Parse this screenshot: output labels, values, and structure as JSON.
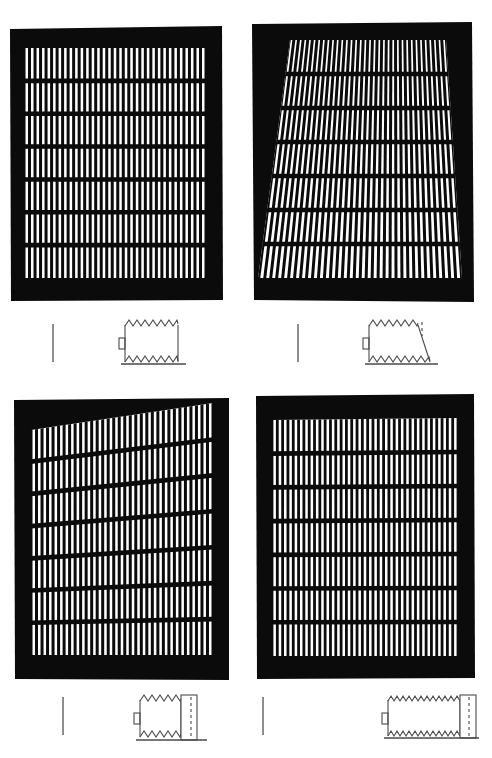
{
  "figure": {
    "background_color": "#ffffff",
    "ink_color": "#000000",
    "schematic_line_color": "#4a4a4a",
    "scalebar_color": "#8e8e8e",
    "width": 492,
    "height": 758,
    "columns": 2,
    "rows": 2,
    "panel_count": 4
  },
  "panels": [
    {
      "id": "panel-a",
      "position": "top-left",
      "name": "grating-panel-top-left",
      "frame": {
        "x": 10,
        "y": 26,
        "w": 213,
        "h": 275
      },
      "shape": "rectangular",
      "description": "Rectangular black frame enclosing a regular orthogonal grating of vertical bars crossed by horizontal rungs",
      "grating": {
        "columns": 33,
        "rows": 7,
        "aperture": {
          "x": 24,
          "y": 48,
          "w": 182,
          "h": 230
        },
        "top_left_offset": 0,
        "top_right_offset": 0,
        "bottom_left_offset": 0,
        "bottom_right_offset": 0,
        "bar_color": "#000000",
        "slot_color": "#ffffff",
        "slot_skew_top": 0,
        "slot_skew_bottom": 0,
        "vertical_bar_width": 2.2,
        "horizontal_rung_height": 4.0
      },
      "scale_bar": {
        "x": 52,
        "y": 324,
        "w": 2,
        "h": 38
      },
      "schematic": {
        "name": "schematic-straight-block",
        "x": 118,
        "y": 320,
        "w": 62,
        "h": 46,
        "type": "straight",
        "teeth": 7,
        "has_right_cap": false,
        "has_dashed_cap": false,
        "has_baseline": true,
        "has_left_tab": true,
        "right_edge": "vertical"
      }
    },
    {
      "id": "panel-b",
      "position": "top-right",
      "name": "grating-panel-top-right",
      "frame": {
        "x": 252,
        "y": 24,
        "w": 220,
        "h": 278
      },
      "shape": "trapezoidal-splayed",
      "description": "Black frame with grating whose bars fan outward, forming a trapezoid that is narrow at the top and wide at the bottom",
      "grating": {
        "columns": 34,
        "rows": 7,
        "aperture": {
          "x": 268,
          "y": 44,
          "w": 188,
          "h": 238
        },
        "top_left_offset": 22,
        "top_right_offset": -14,
        "bottom_left_offset": -8,
        "bottom_right_offset": 6,
        "bar_color": "#000000",
        "slot_color": "#ffffff",
        "slot_skew_top": 10,
        "slot_skew_bottom": -10,
        "vertical_bar_width": 2.2,
        "horizontal_rung_height": 4.0
      },
      "scale_bar": {
        "x": 297,
        "y": 324,
        "w": 2,
        "h": 38
      },
      "schematic": {
        "name": "schematic-sheared-block",
        "x": 364,
        "y": 320,
        "w": 68,
        "h": 46,
        "type": "sheared",
        "teeth": 7,
        "has_right_cap": false,
        "has_dashed_cap": true,
        "has_baseline": true,
        "has_left_tab": true,
        "right_edge": "slanted"
      }
    },
    {
      "id": "panel-c",
      "position": "bottom-left",
      "name": "grating-panel-bottom-left",
      "frame": {
        "x": 14,
        "y": 400,
        "w": 215,
        "h": 280
      },
      "shape": "wedge-sloped-top",
      "description": "Black frame whose grating aperture has a sloping upper edge so the bars grow taller from left to right",
      "grating": {
        "columns": 33,
        "rows": 7,
        "aperture": {
          "x": 30,
          "y": 424,
          "w": 185,
          "h": 232
        },
        "top_left_offset": 0,
        "top_right_offset": 34,
        "bottom_left_offset": 0,
        "bottom_right_offset": 0,
        "bar_color": "#000000",
        "slot_color": "#ffffff",
        "slot_skew_top": 4,
        "slot_skew_bottom": 0,
        "vertical_bar_width": 2.2,
        "horizontal_rung_height": 4.0
      },
      "scale_bar": {
        "x": 62,
        "y": 700,
        "w": 2,
        "h": 38
      },
      "schematic": {
        "name": "schematic-capped-block",
        "x": 133,
        "y": 696,
        "w": 70,
        "h": 46,
        "type": "capped",
        "teeth": 7,
        "has_right_cap": true,
        "has_dashed_cap": true,
        "has_baseline": true,
        "has_left_tab": true,
        "right_edge": "vertical"
      }
    },
    {
      "id": "panel-d",
      "position": "bottom-right",
      "name": "grating-panel-bottom-right",
      "frame": {
        "x": 256,
        "y": 396,
        "w": 218,
        "h": 283
      },
      "shape": "rectangular",
      "description": "Black frame enclosing a dense regular grating of straight vertical bars with horizontal rungs",
      "grating": {
        "columns": 35,
        "rows": 7,
        "aperture": {
          "x": 272,
          "y": 420,
          "w": 186,
          "h": 235
        },
        "top_left_offset": 0,
        "top_right_offset": 0,
        "bottom_left_offset": 0,
        "bottom_right_offset": 0,
        "bar_color": "#000000",
        "slot_color": "#ffffff",
        "slot_skew_top": 0,
        "slot_skew_bottom": 0,
        "vertical_bar_width": 2.0,
        "horizontal_rung_height": 4.0
      },
      "scale_bar": {
        "x": 262,
        "y": 700,
        "w": 2,
        "h": 38
      },
      "schematic": {
        "name": "schematic-wide-capped-block",
        "x": 381,
        "y": 697,
        "w": 93,
        "h": 44,
        "type": "wide-capped",
        "teeth": 13,
        "has_right_cap": true,
        "has_dashed_cap": true,
        "has_baseline": true,
        "has_left_tab": true,
        "right_edge": "vertical"
      }
    }
  ]
}
